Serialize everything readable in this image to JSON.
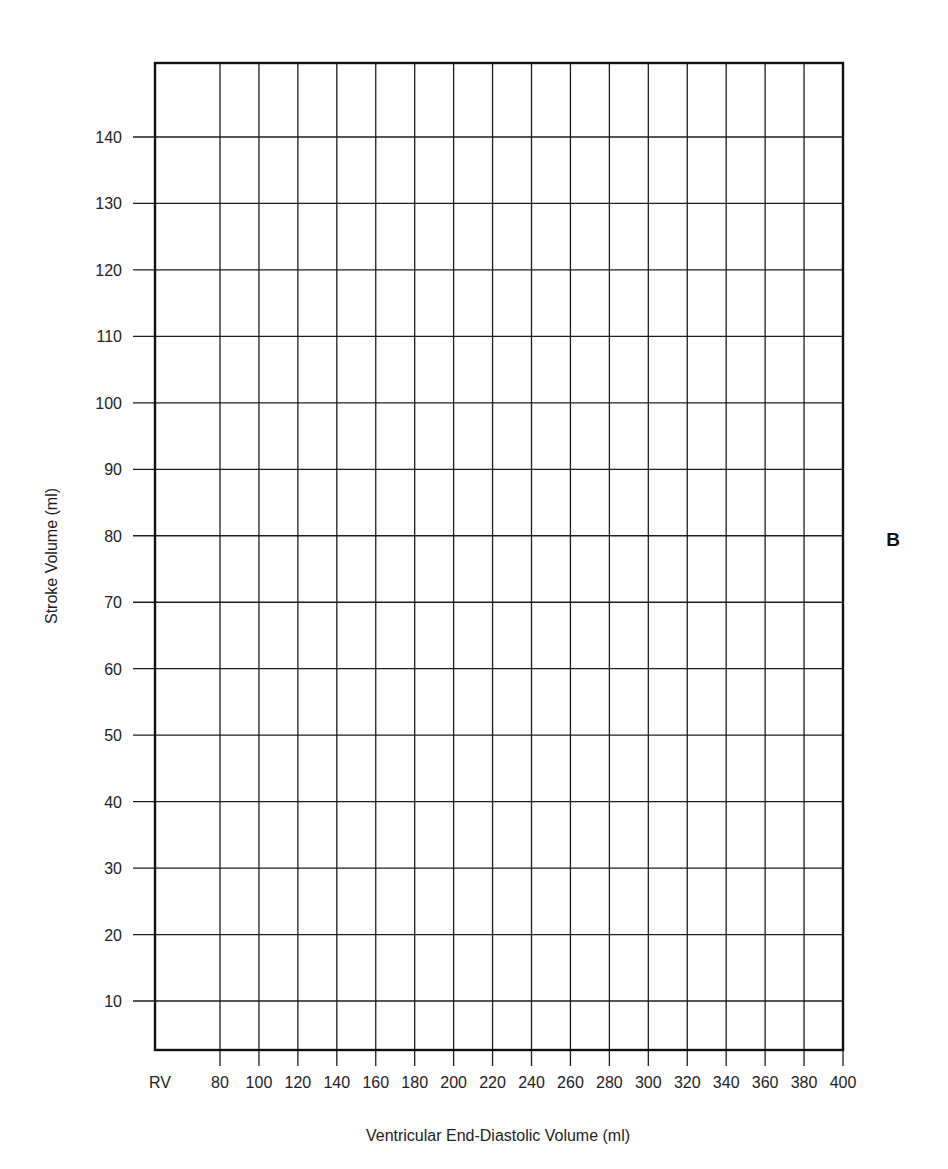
{
  "chart_data": {
    "type": "line",
    "title": "",
    "panel_label": "B",
    "xlabel": "Ventricular End-Diastolic Volume (ml)",
    "ylabel": "Stroke Volume (ml)",
    "x_tick_labels": [
      "RV",
      "80",
      "100",
      "120",
      "140",
      "160",
      "180",
      "200",
      "220",
      "240",
      "260",
      "280",
      "300",
      "320",
      "340",
      "360",
      "380",
      "400"
    ],
    "x_ticks": [
      80,
      100,
      120,
      140,
      160,
      180,
      200,
      220,
      240,
      260,
      280,
      300,
      320,
      340,
      360,
      380,
      400
    ],
    "y_tick_labels": [
      "10",
      "20",
      "30",
      "40",
      "50",
      "60",
      "70",
      "80",
      "90",
      "100",
      "110",
      "120",
      "130",
      "140"
    ],
    "y_ticks": [
      10,
      20,
      30,
      40,
      50,
      60,
      70,
      80,
      90,
      100,
      110,
      120,
      130,
      140
    ],
    "xlim": [
      "RV",
      400
    ],
    "ylim": [
      3,
      151
    ],
    "grid": true,
    "legend": null,
    "series": []
  },
  "colors": {
    "grid": "#1e1e1e",
    "frame": "#111111",
    "text": "#222222",
    "background": "#ffffff"
  }
}
